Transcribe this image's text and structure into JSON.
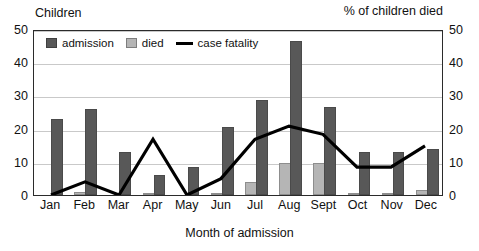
{
  "header": {
    "left_label": "Children",
    "right_label": "% of children died"
  },
  "legend": {
    "position": "inside-top-left",
    "items": [
      {
        "key": "admission",
        "label": "admission",
        "marker": "square",
        "color": "#585858"
      },
      {
        "key": "died",
        "label": "died",
        "marker": "square",
        "color": "#b5b5b5"
      },
      {
        "key": "case_fatality",
        "label": "case fatality",
        "marker": "line",
        "color": "#000000"
      }
    ]
  },
  "axes": {
    "x_title": "Month of admission",
    "y_left_ticks": [
      "50",
      "40",
      "30",
      "20",
      "10",
      "0"
    ],
    "y_right_ticks": [
      "50",
      "40",
      "30",
      "20",
      "10",
      "0"
    ]
  },
  "chart_data": {
    "type": "bar",
    "title": "",
    "subtitle": "",
    "xlabel": "Month of admission",
    "ylabel": "Children",
    "y2label": "% of children died",
    "ylim": [
      0,
      50
    ],
    "y2lim": [
      0,
      50
    ],
    "yticks": [
      0,
      10,
      20,
      30,
      40,
      50
    ],
    "grid": true,
    "legend": "inside top-left",
    "categories": [
      "Jan",
      "Feb",
      "Mar",
      "Apr",
      "May",
      "Jun",
      "Jul",
      "Aug",
      "Sept",
      "Oct",
      "Nov",
      "Dec"
    ],
    "series": [
      {
        "name": "admission",
        "type": "bar",
        "axis": "left",
        "color": "#585858",
        "values": [
          23,
          26,
          13,
          6,
          8.5,
          20.5,
          28.5,
          46.5,
          26.5,
          13,
          13,
          14
        ]
      },
      {
        "name": "died",
        "type": "bar",
        "axis": "left",
        "color": "#b5b5b5",
        "values": [
          0,
          0.8,
          0,
          0.6,
          0,
          0.7,
          4,
          9.5,
          9.5,
          0.6,
          0.5,
          1.5
        ]
      },
      {
        "name": "case fatality",
        "type": "line",
        "axis": "right",
        "color": "#000000",
        "values": [
          0,
          4,
          0,
          17,
          0,
          5,
          17,
          21,
          18.5,
          8.5,
          8.5,
          15
        ]
      }
    ]
  }
}
